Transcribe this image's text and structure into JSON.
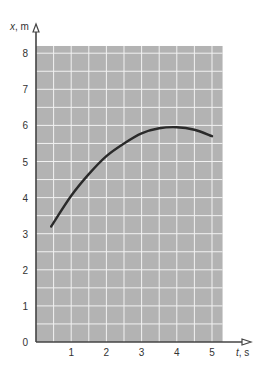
{
  "chart_data": {
    "type": "line",
    "title": "",
    "xlabel": "t, s",
    "ylabel": "x, m",
    "xlim": [
      0,
      5.3
    ],
    "ylim": [
      0,
      8.2
    ],
    "xticks": [
      "1",
      "2",
      "3",
      "4",
      "5"
    ],
    "yticks": [
      "0",
      "1",
      "2",
      "3",
      "4",
      "5",
      "6",
      "7",
      "8"
    ],
    "grid": true,
    "grid_step": {
      "x": 0.5,
      "y": 0.5
    },
    "colors": {
      "grid_bg": "#b3b3b3",
      "grid_line": "#f2f2f2",
      "curve": "#2a2a2a",
      "axis": "#444444"
    },
    "series": [
      {
        "name": "x(t)",
        "x": [
          0.43,
          1.0,
          1.5,
          2.0,
          2.5,
          3.0,
          3.5,
          4.0,
          4.5,
          5.0
        ],
        "y": [
          3.2,
          4.05,
          4.65,
          5.15,
          5.5,
          5.78,
          5.92,
          5.95,
          5.88,
          5.7
        ]
      }
    ]
  }
}
